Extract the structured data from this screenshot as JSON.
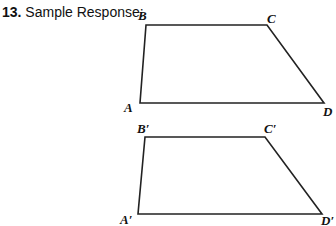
{
  "heading": {
    "number": "13.",
    "text": "Sample Response:"
  },
  "figures": [
    {
      "name": "original",
      "labels": {
        "A": "A",
        "B": "B",
        "C": "C",
        "D": "D"
      }
    },
    {
      "name": "image",
      "labels": {
        "A": "A′",
        "B": "B′",
        "C": "C′",
        "D": "D′"
      }
    }
  ]
}
